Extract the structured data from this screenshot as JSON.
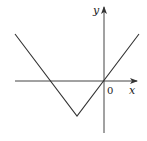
{
  "diagram": {
    "type": "function-graph",
    "axes": {
      "x_label": "x",
      "y_label": "y",
      "origin_label": "0"
    },
    "colors": {
      "line": "#333333",
      "background": "#ffffff"
    },
    "graph_points_px": [
      [
        15,
        34
      ],
      [
        77,
        116
      ],
      [
        139,
        34
      ]
    ],
    "vertex_px": [
      77,
      116
    ],
    "x_intercepts_px": [
      [
        50,
        81
      ],
      [
        104,
        81
      ]
    ]
  }
}
